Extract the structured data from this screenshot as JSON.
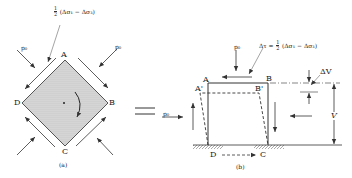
{
  "panel_a": {
    "caption": "(a)",
    "annotation_prefix": "1/2",
    "annotation_expr": "(Δσ₁ − Δσ₃)",
    "corners": {
      "top": "A",
      "right": "B",
      "bottom": "C",
      "left": "D"
    },
    "pressure_label_left": "p₀",
    "pressure_label_right": "p₀"
  },
  "equals_sign": "=",
  "panel_b": {
    "caption": "(b)",
    "pressure_top": "p₀",
    "pressure_left": "p₀",
    "annotation_lhs": "Δτ =",
    "annotation_expr": "(Δσ₁ − Δσ₃)",
    "corners_solid": {
      "top_left": "A",
      "top_right": "B",
      "bottom_left": "D",
      "bottom_right": "C"
    },
    "corners_dashed": {
      "top_left": "A'",
      "top_right": "B'"
    },
    "delta_v_label": "ΔV",
    "v_label": "V"
  },
  "colors": {
    "line": "#333333",
    "fill": "#cfcfcf"
  }
}
